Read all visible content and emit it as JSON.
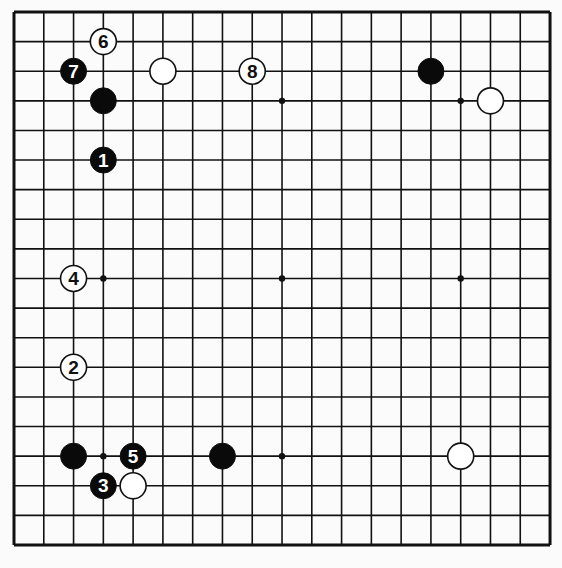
{
  "board": {
    "size": 19,
    "origin_x": 14,
    "origin_y": 12,
    "spacing_x": 29.78,
    "spacing_y": 29.61,
    "stone_radius": 13,
    "line_color": "#111111",
    "background": "#fbfbfb",
    "star_points": [
      [
        3,
        3
      ],
      [
        9,
        3
      ],
      [
        15,
        3
      ],
      [
        3,
        9
      ],
      [
        9,
        9
      ],
      [
        15,
        9
      ],
      [
        3,
        15
      ],
      [
        9,
        15
      ],
      [
        15,
        15
      ]
    ]
  },
  "stones": [
    {
      "color": "white",
      "col": 3,
      "row": 1,
      "label": "6"
    },
    {
      "color": "black",
      "col": 2,
      "row": 2,
      "label": "7"
    },
    {
      "color": "white",
      "col": 5,
      "row": 2,
      "label": ""
    },
    {
      "color": "white",
      "col": 8,
      "row": 2,
      "label": "8"
    },
    {
      "color": "black",
      "col": 3,
      "row": 3,
      "label": ""
    },
    {
      "color": "black",
      "col": 3,
      "row": 5,
      "label": "1"
    },
    {
      "color": "black",
      "col": 14,
      "row": 2,
      "label": ""
    },
    {
      "color": "white",
      "col": 16,
      "row": 3,
      "label": ""
    },
    {
      "color": "white",
      "col": 2,
      "row": 9,
      "label": "4"
    },
    {
      "color": "white",
      "col": 2,
      "row": 12,
      "label": "2"
    },
    {
      "color": "black",
      "col": 2,
      "row": 15,
      "label": ""
    },
    {
      "color": "black",
      "col": 4,
      "row": 15,
      "label": "5"
    },
    {
      "color": "black",
      "col": 7,
      "row": 15,
      "label": ""
    },
    {
      "color": "black",
      "col": 3,
      "row": 16,
      "label": "3"
    },
    {
      "color": "white",
      "col": 4,
      "row": 16,
      "label": ""
    },
    {
      "color": "white",
      "col": 15,
      "row": 15,
      "label": ""
    }
  ]
}
